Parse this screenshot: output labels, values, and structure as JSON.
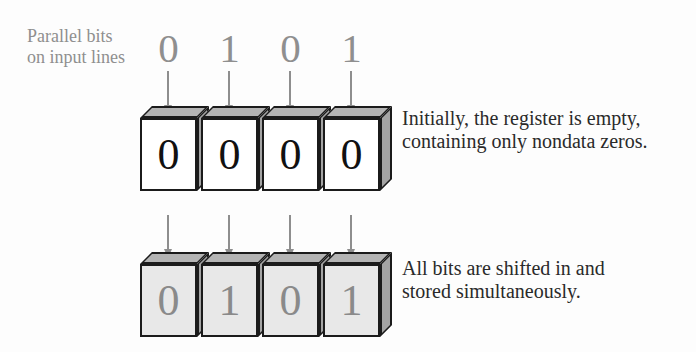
{
  "palette": {
    "background": "#fdfdfd",
    "outline": "#1b1b1b",
    "gray_text": "#8f8f8f",
    "arrow_gray": "#8e8e8e",
    "cube_top_face": "#b4b4b4",
    "cube_side_face": "#a4a4a4",
    "cube_front_empty": "#ffffff",
    "cube_front_stored": "#e8e8e8",
    "digit_black": "#111111",
    "digit_gray": "#8a8a8a",
    "caption_text": "#2a2a2a"
  },
  "input_label": {
    "line1": "Parallel bits",
    "line2": "on input lines"
  },
  "input_bits": [
    "0",
    "1",
    "0",
    "1"
  ],
  "register_empty": {
    "cells": [
      "0",
      "0",
      "0",
      "0"
    ],
    "caption_line1": "Initially, the register is empty,",
    "caption_line2": "containing only nondata zeros."
  },
  "register_stored": {
    "cells": [
      "0",
      "1",
      "0",
      "1"
    ],
    "caption_line1": "All bits are shifted in and",
    "caption_line2": "stored simultaneously."
  }
}
